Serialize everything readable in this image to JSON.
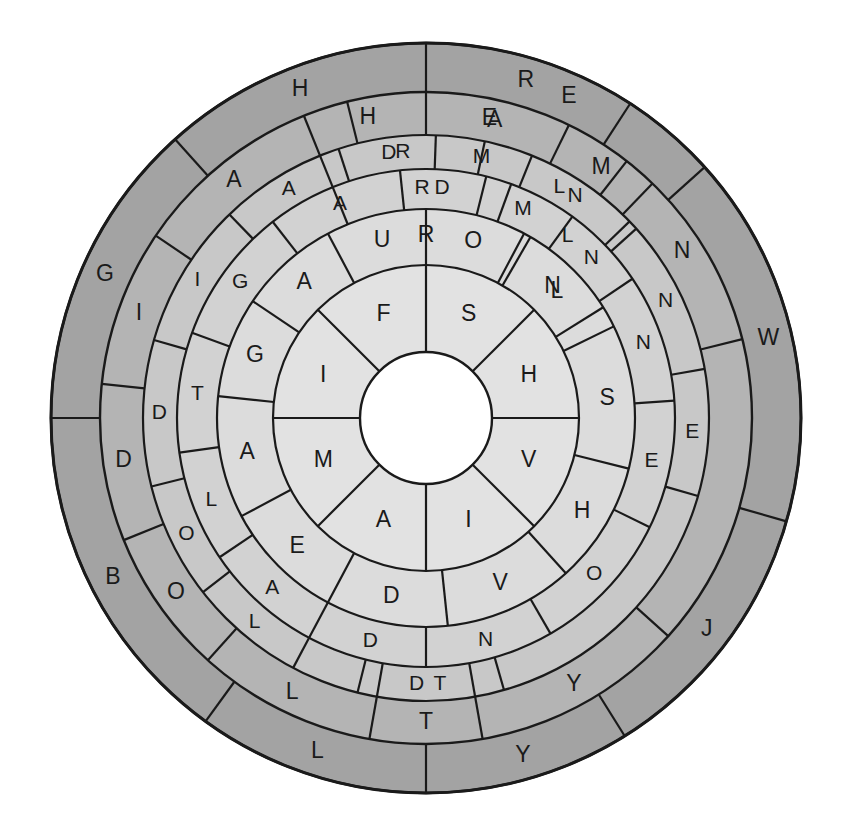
{
  "figure": {
    "type": "radial-letter-wheel",
    "center": {
      "x": 426,
      "y": 418
    },
    "outer_radius": 375,
    "background_color": "#ffffff",
    "stroke_color": "#1a1a1a",
    "hub_color": "#ffffff",
    "hub_radius": 66
  },
  "chart_data": {
    "type": "pie",
    "xlabel": "",
    "ylabel": "",
    "legend": "none",
    "grid": false,
    "rings": [
      {
        "index": 1,
        "name": "outer-ring",
        "r_inner": 326,
        "r_outer": 375,
        "color": "#a3a3a3",
        "cells": [
          {
            "label": "E",
            "start_deg": -90,
            "end_deg": -42
          },
          {
            "label": "W",
            "start_deg": -42,
            "end_deg": 16
          },
          {
            "label": "J",
            "start_deg": 16,
            "end_deg": 58
          },
          {
            "label": "Y",
            "start_deg": 58,
            "end_deg": 90
          },
          {
            "label": "L",
            "start_deg": 90,
            "end_deg": 126
          },
          {
            "label": "B",
            "start_deg": 126,
            "end_deg": 180
          },
          {
            "label": "G",
            "start_deg": 180,
            "end_deg": 228
          },
          {
            "label": "H",
            "start_deg": 228,
            "end_deg": 270
          },
          {
            "label": "R",
            "start_deg": 270,
            "end_deg": 303
          },
          {
            "label": "",
            "start_deg": 303,
            "end_deg": 318
          }
        ]
      },
      {
        "index": 2,
        "name": "ring-2",
        "r_inner": 283,
        "r_outer": 326,
        "color": "#b4b4b4",
        "cells": [
          {
            "label": "E",
            "start_deg": -104,
            "end_deg": -52
          },
          {
            "label": "N",
            "start_deg": -52,
            "end_deg": -14
          },
          {
            "label": "Y",
            "start_deg": 42,
            "end_deg": 80
          },
          {
            "label": "T",
            "start_deg": 80,
            "end_deg": 100
          },
          {
            "label": "L",
            "start_deg": 100,
            "end_deg": 132
          },
          {
            "label": "O",
            "start_deg": 132,
            "end_deg": 158
          },
          {
            "label": "D",
            "start_deg": 158,
            "end_deg": 186
          },
          {
            "label": "I",
            "start_deg": 186,
            "end_deg": 214
          },
          {
            "label": "A",
            "start_deg": 214,
            "end_deg": 248
          },
          {
            "label": "H",
            "start_deg": 248,
            "end_deg": 270
          },
          {
            "label": "A",
            "start_deg": 270,
            "end_deg": 296
          },
          {
            "label": "M",
            "start_deg": 296,
            "end_deg": 314
          }
        ]
      },
      {
        "index": 3,
        "name": "ring-3",
        "r_inner": 249,
        "r_outer": 283,
        "color": "#c8c8c8",
        "cells": [
          {
            "label": "R",
            "start_deg": -112,
            "end_deg": -78
          },
          {
            "label": "L",
            "start_deg": -78,
            "end_deg": -42
          },
          {
            "label": "N",
            "start_deg": -42,
            "end_deg": -10
          },
          {
            "label": "E",
            "start_deg": -10,
            "end_deg": 16
          },
          {
            "label": "T",
            "start_deg": 74,
            "end_deg": 100
          },
          {
            "label": "L",
            "start_deg": 118,
            "end_deg": 142
          },
          {
            "label": "D",
            "start_deg": 80,
            "end_deg": 104
          },
          {
            "label": "O",
            "start_deg": 142,
            "end_deg": 166
          },
          {
            "label": "D",
            "start_deg": 166,
            "end_deg": 196
          },
          {
            "label": "I",
            "start_deg": 196,
            "end_deg": 226
          },
          {
            "label": "A",
            "start_deg": 226,
            "end_deg": 252
          },
          {
            "label": "D",
            "start_deg": 252,
            "end_deg": 272
          },
          {
            "label": "M",
            "start_deg": 272,
            "end_deg": 292
          },
          {
            "label": "N",
            "start_deg": 292,
            "end_deg": 316
          }
        ]
      },
      {
        "index": 4,
        "name": "ring-4",
        "r_inner": 209,
        "r_outer": 249,
        "color": "#d2d2d2",
        "cells": [
          {
            "label": "R",
            "start_deg": -112,
            "end_deg": -70
          },
          {
            "label": "L",
            "start_deg": -70,
            "end_deg": -34
          },
          {
            "label": "N",
            "start_deg": -34,
            "end_deg": -4
          },
          {
            "label": "E",
            "start_deg": -4,
            "end_deg": 26
          },
          {
            "label": "O",
            "start_deg": 26,
            "end_deg": 60
          },
          {
            "label": "N",
            "start_deg": 60,
            "end_deg": 90
          },
          {
            "label": "D",
            "start_deg": 90,
            "end_deg": 118
          },
          {
            "label": "A",
            "start_deg": 118,
            "end_deg": 146
          },
          {
            "label": "L",
            "start_deg": 146,
            "end_deg": 172
          },
          {
            "label": "T",
            "start_deg": 172,
            "end_deg": 200
          },
          {
            "label": "G",
            "start_deg": 200,
            "end_deg": 232
          },
          {
            "label": "A",
            "start_deg": 232,
            "end_deg": 264
          },
          {
            "label": "D",
            "start_deg": 264,
            "end_deg": 284
          },
          {
            "label": "M",
            "start_deg": 284,
            "end_deg": 306
          },
          {
            "label": "N",
            "start_deg": 306,
            "end_deg": 326
          }
        ]
      },
      {
        "index": 5,
        "name": "ring-5",
        "r_inner": 153,
        "r_outer": 209,
        "color": "#dcdcdc",
        "cells": [
          {
            "label": "R",
            "start_deg": -118,
            "end_deg": -62
          },
          {
            "label": "L",
            "start_deg": -62,
            "end_deg": -26
          },
          {
            "label": "S",
            "start_deg": -26,
            "end_deg": 14
          },
          {
            "label": "H",
            "start_deg": 14,
            "end_deg": 48
          },
          {
            "label": "V",
            "start_deg": 48,
            "end_deg": 84
          },
          {
            "label": "D",
            "start_deg": 84,
            "end_deg": 118
          },
          {
            "label": "E",
            "start_deg": 118,
            "end_deg": 152
          },
          {
            "label": "A",
            "start_deg": 152,
            "end_deg": 186
          },
          {
            "label": "G",
            "start_deg": 186,
            "end_deg": 214
          },
          {
            "label": "A",
            "start_deg": 214,
            "end_deg": 242
          },
          {
            "label": "U",
            "start_deg": 242,
            "end_deg": 270
          },
          {
            "label": "O",
            "start_deg": 270,
            "end_deg": 300
          },
          {
            "label": "N",
            "start_deg": 300,
            "end_deg": 328
          }
        ]
      },
      {
        "index": 6,
        "name": "inner-ring",
        "r_inner": 66,
        "r_outer": 153,
        "color": "#e2e2e2",
        "cells": [
          {
            "label": "F",
            "start_deg": -135,
            "end_deg": -90
          },
          {
            "label": "S",
            "start_deg": -90,
            "end_deg": -45
          },
          {
            "label": "H",
            "start_deg": -45,
            "end_deg": 0
          },
          {
            "label": "V",
            "start_deg": 0,
            "end_deg": 45
          },
          {
            "label": "I",
            "start_deg": 45,
            "end_deg": 90
          },
          {
            "label": "A",
            "start_deg": 90,
            "end_deg": 135
          },
          {
            "label": "M",
            "start_deg": 135,
            "end_deg": 180
          },
          {
            "label": "I",
            "start_deg": 180,
            "end_deg": 225
          }
        ]
      }
    ],
    "labels_clockwise_from_top": {
      "outer_ring": [
        "W",
        "J",
        "Y",
        "L",
        "B",
        "G",
        "H",
        "R",
        "E"
      ],
      "ring_2": [
        "N",
        "E",
        "T",
        "O",
        "L",
        "D",
        "I",
        "A",
        "H",
        "A",
        "M",
        "E"
      ],
      "ring_3": [
        "L",
        "N",
        "E",
        "T",
        "O",
        "D",
        "A",
        "I",
        "G",
        "A",
        "D",
        "M",
        "N",
        "R"
      ],
      "ring_4": [
        "L",
        "N",
        "E",
        "O",
        "N",
        "D",
        "A",
        "L",
        "T",
        "G",
        "A",
        "D",
        "M",
        "N",
        "R"
      ],
      "ring_5": [
        "L",
        "S",
        "H",
        "V",
        "D",
        "E",
        "A",
        "G",
        "A",
        "U",
        "O",
        "N",
        "R"
      ],
      "inner_ring": [
        "S",
        "H",
        "V",
        "I",
        "A",
        "M",
        "I",
        "F"
      ]
    }
  },
  "ring_letters": {
    "outer": {
      "E": "E",
      "W": "W",
      "J": "J",
      "Y": "Y",
      "L": "L",
      "B": "B",
      "G": "G",
      "H": "H",
      "R": "R"
    },
    "inner": {
      "F": "F",
      "S": "S",
      "H": "H",
      "V": "V",
      "I1": "I",
      "A": "A",
      "M": "M",
      "I2": "I"
    }
  },
  "letters": {
    "outer_ring": [
      "E",
      "W",
      "J",
      "Y",
      "L",
      "B",
      "G",
      "H",
      "R"
    ],
    "second_ring": [
      "E",
      "N",
      "E",
      "T",
      "O",
      "L",
      "D",
      "I",
      "A",
      "H",
      "A",
      "M"
    ],
    "third_ring": [
      "R",
      "L",
      "N",
      "E",
      "T",
      "D",
      "L",
      "O",
      "D",
      "I",
      "A",
      "D",
      "M",
      "N"
    ],
    "fourth_ring": [
      "R",
      "L",
      "N",
      "E",
      "O",
      "N",
      "D",
      "A",
      "L",
      "T",
      "G",
      "A",
      "D",
      "M",
      "N"
    ],
    "fifth_ring": [
      "R",
      "L",
      "S",
      "H",
      "V",
      "D",
      "E",
      "A",
      "G",
      "A",
      "U",
      "O",
      "N"
    ],
    "inner_ring": [
      "F",
      "S",
      "H",
      "V",
      "I",
      "A",
      "M",
      "I"
    ]
  }
}
